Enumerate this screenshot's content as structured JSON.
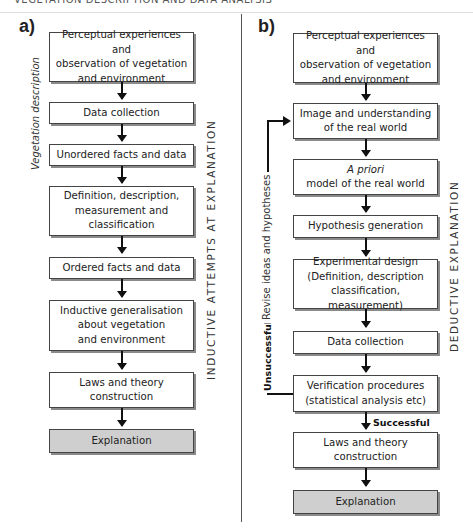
{
  "page_header": "VEGETATION DESCRIPTION AND DATA ANALYSIS",
  "panel_a": {
    "label": "a)",
    "side_label_left": "Vegetation description",
    "side_label_right": "INDUCTIVE ATTEMPTS AT EXPLANATION",
    "boxes": [
      "Perceptual experiences and\nobservation of vegetation\nand environment",
      "Data collection",
      "Unordered facts and data",
      "Definition, description,\nmeasurement and\nclassification",
      "Ordered facts and data",
      "Inductive generalisation\nabout vegetation\nand environment",
      "Laws and theory\nconstruction",
      "Explanation"
    ]
  },
  "panel_b": {
    "label": "b)",
    "side_label_right": "DEDUCTIVE EXPLANATION",
    "feedback_label": "Revise ideas and hypotheses",
    "unsuccessful_label": "Unsuccessful",
    "successful_label": "Successful",
    "boxes": [
      "Perceptual experiences and\nobservation of vegetation\nand environment",
      "Image and understanding\nof the real world",
      "model of the real world",
      "Hypothesis generation",
      "Experimental design\n(Definition, description\nclassification, measurement)",
      "Data collection",
      "Verification procedures\n(statistical analysis etc)",
      "Laws and theory\nconstruction",
      "Explanation"
    ],
    "a_priori_italic": "A priori"
  },
  "colors": {
    "box_border": "#444444",
    "box_shadow": "#8a8a8a",
    "final_box_fill": "#cfcfcf",
    "arrow": "#111111"
  }
}
